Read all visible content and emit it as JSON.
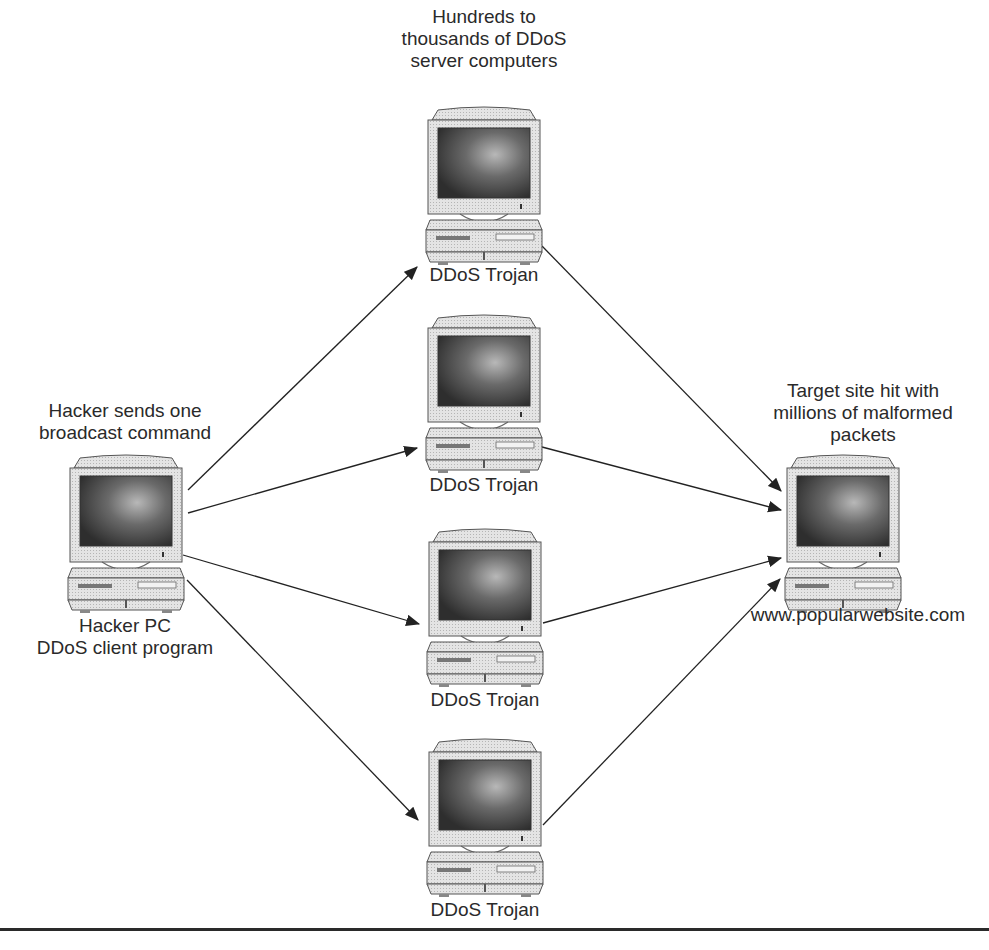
{
  "diagram": {
    "colors": {
      "line": "#222222",
      "screen_dark": "#3a3a3a",
      "screen_light": "#9a9a9a",
      "case": "#e6e6e6",
      "case_shade": "#c8c8c8",
      "rule": "#2a2a2a"
    },
    "nodes": [
      {
        "id": "hacker",
        "caption_above": [
          "Hacker sends one",
          "broadcast command"
        ],
        "caption_below": [
          "Hacker PC",
          "DDoS client program"
        ]
      },
      {
        "id": "trojan1",
        "caption_above": [
          "Hundreds to",
          "thousands of DDoS",
          "server computers"
        ],
        "caption_below": [
          "DDoS Trojan"
        ]
      },
      {
        "id": "trojan2",
        "caption_above": [],
        "caption_below": [
          "DDoS Trojan"
        ]
      },
      {
        "id": "trojan3",
        "caption_above": [],
        "caption_below": [
          "DDoS Trojan"
        ]
      },
      {
        "id": "trojan4",
        "caption_above": [],
        "caption_below": [
          "DDoS Trojan"
        ]
      },
      {
        "id": "target",
        "caption_above": [
          "Target site hit with",
          "millions of malformed",
          "packets"
        ],
        "caption_below": [
          "www.popularwebsite.com"
        ]
      }
    ],
    "edges": [
      {
        "from": "hacker",
        "to": "trojan1"
      },
      {
        "from": "hacker",
        "to": "trojan2"
      },
      {
        "from": "hacker",
        "to": "trojan3"
      },
      {
        "from": "hacker",
        "to": "trojan4"
      },
      {
        "from": "trojan1",
        "to": "target"
      },
      {
        "from": "trojan2",
        "to": "target"
      },
      {
        "from": "trojan3",
        "to": "target"
      },
      {
        "from": "trojan4",
        "to": "target"
      }
    ]
  }
}
